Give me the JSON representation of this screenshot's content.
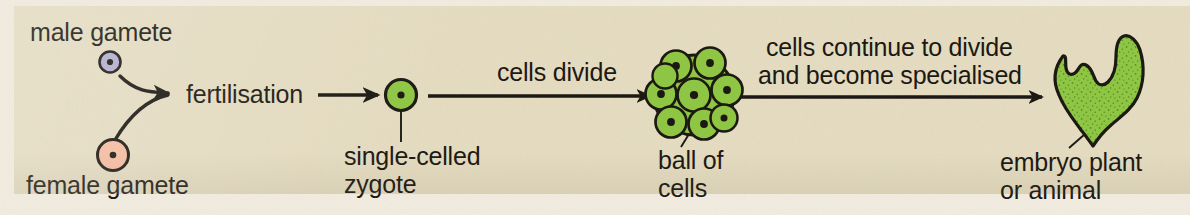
{
  "figure": {
    "kind": "biology-flow-diagram",
    "topic": "fertilisation to embryo development",
    "background_color": "#f2ece0",
    "panel_color": "#e5dcc0",
    "ink_color": "#16120c"
  },
  "labels": {
    "male_gamete": "male gamete",
    "female_gamete": "female gamete",
    "fertilisation": "fertilisation",
    "zygote_line1": "single-celled",
    "zygote_line2": "zygote",
    "cells_divide": "cells divide",
    "ball_line1": "ball of",
    "ball_line2": "cells",
    "specialise_line1": "cells continue to divide",
    "specialise_line2": "and become specialised",
    "embryo_line1": "embryo plant",
    "embryo_line2": "or animal"
  },
  "cells": {
    "male_gamete": {
      "name": "male gamete cell",
      "fill": "#b3adcd",
      "stroke": "#16120c",
      "nucleus": "#16120c",
      "radius": 10
    },
    "female_gamete": {
      "name": "female gamete cell",
      "fill": "#f6bb9f",
      "stroke": "#16120c",
      "nucleus": "#16120c",
      "radius": 15
    },
    "zygote": {
      "name": "single-celled zygote",
      "fill": "#8dc63f",
      "stroke": "#16120c",
      "nucleus": "#16120c",
      "radius": 15
    },
    "ball_of_cells": {
      "name": "ball of cells",
      "fill": "#8dc63f",
      "stroke": "#16120c",
      "nucleus": "#16120c",
      "cell_count": 9,
      "cluster_radius": 41
    },
    "embryo": {
      "name": "embryo plant or animal",
      "fill": "#8dc63f",
      "stroke": "#16120c",
      "texture": "stippled",
      "shape": "irregular two-lobed V form"
    }
  },
  "arrows": [
    {
      "name": "male-gamete-to-fertilisation",
      "style": "curved",
      "from": "male gamete",
      "to": "fertilisation"
    },
    {
      "name": "female-gamete-to-fertilisation",
      "style": "curved",
      "from": "female gamete",
      "to": "fertilisation"
    },
    {
      "name": "fertilisation-to-zygote",
      "style": "straight",
      "from": "fertilisation",
      "to": "single-celled zygote",
      "caption": ""
    },
    {
      "name": "zygote-to-ball-of-cells",
      "style": "straight",
      "from": "single-celled zygote",
      "to": "ball of cells",
      "caption": "cells divide"
    },
    {
      "name": "ball-of-cells-to-embryo",
      "style": "straight",
      "from": "ball of cells",
      "to": "embryo plant or animal",
      "caption": "cells continue to divide and become specialised"
    }
  ],
  "leader_lines": [
    {
      "name": "zygote-leader",
      "target": "single-celled zygote"
    },
    {
      "name": "ball-of-cells-leader",
      "target": "ball of cells"
    },
    {
      "name": "embryo-leader",
      "target": "embryo plant or animal"
    }
  ],
  "stages": [
    {
      "order": 1,
      "name": "male gamete"
    },
    {
      "order": 2,
      "name": "female gamete"
    },
    {
      "order": 3,
      "name": "fertilisation"
    },
    {
      "order": 4,
      "name": "single-celled zygote"
    },
    {
      "order": 5,
      "name": "ball of cells"
    },
    {
      "order": 6,
      "name": "embryo plant or animal"
    }
  ]
}
